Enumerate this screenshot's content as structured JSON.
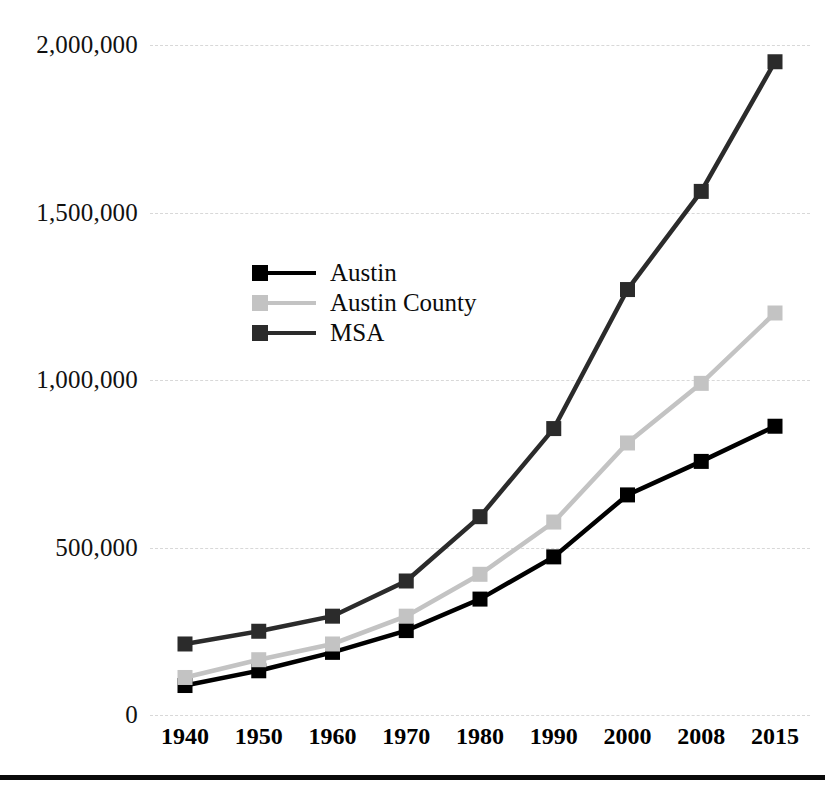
{
  "chart_data": {
    "type": "line",
    "title": "",
    "xlabel": "",
    "ylabel": "",
    "categories": [
      "1940",
      "1950",
      "1960",
      "1970",
      "1980",
      "1990",
      "2000",
      "2008",
      "2015"
    ],
    "x": [
      1940,
      1950,
      1960,
      1970,
      1980,
      1990,
      2000,
      2008,
      2015
    ],
    "ylim": [
      0,
      2000000
    ],
    "xlim_categories": [
      "1940",
      "2015"
    ],
    "grid": true,
    "grid_axis": "y",
    "grid_style": "dashed",
    "legend_position": "inside-upper-left-center",
    "ytick_labels": [
      "2,000,000",
      "1,500,000",
      "1,000,000",
      "500,000",
      "0"
    ],
    "ytick_values": [
      2000000,
      1500000,
      1000000,
      500000,
      0
    ],
    "series": [
      {
        "name": "Austin",
        "color": "#000000",
        "marker": "square",
        "values": [
          88000,
          132000,
          187000,
          252000,
          346000,
          472000,
          657000,
          757000,
          862000
        ]
      },
      {
        "name": "Austin County",
        "color": "#c3c3c3",
        "marker": "square",
        "values": [
          112000,
          165000,
          212000,
          295000,
          420000,
          576000,
          812000,
          990000,
          1200000
        ]
      },
      {
        "name": "MSA",
        "color": "#2b2b2b",
        "marker": "square",
        "values": [
          212000,
          250000,
          295000,
          400000,
          592000,
          855000,
          1270000,
          1563000,
          1950000
        ]
      }
    ]
  },
  "legend": {
    "items": [
      {
        "label": "Austin",
        "color": "#000000"
      },
      {
        "label": "Austin County",
        "color": "#c3c3c3"
      },
      {
        "label": "MSA",
        "color": "#2b2b2b"
      }
    ]
  },
  "colors": {
    "gridline": "#d8d8d8",
    "axis_text": "#000000",
    "background": "#ffffff",
    "bottom_rule": "#0a0a0a"
  }
}
